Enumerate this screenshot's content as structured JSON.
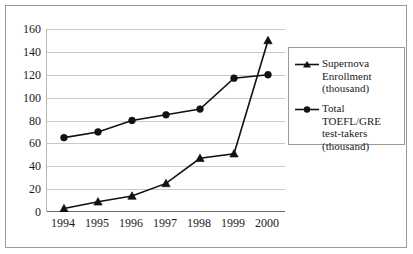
{
  "chart_data": {
    "type": "line",
    "title": "",
    "xlabel": "",
    "ylabel": "",
    "categories": [
      "1994",
      "1995",
      "1996",
      "1997",
      "1998",
      "1999",
      "2000"
    ],
    "ylim": [
      0,
      160
    ],
    "ytick_step": 20,
    "yticks": [
      "0",
      "20",
      "40",
      "60",
      "80",
      "100",
      "120",
      "140",
      "160"
    ],
    "grid": true,
    "legend_position": "right",
    "series": [
      {
        "name": "Supernova Enrollment (thousand)",
        "legend_label": "Supernova\nEnrollment\n(thousand)",
        "marker": "triangle",
        "color": "#111111",
        "values": [
          3,
          9,
          14,
          25,
          47,
          51,
          150
        ]
      },
      {
        "name": "Total TOEFL/GRE test-takers (thousand)",
        "legend_label": "Total TOEFL/GRE\ntest-takers\n(thousand)",
        "marker": "circle",
        "color": "#111111",
        "values": [
          65,
          70,
          80,
          85,
          90,
          117,
          120
        ]
      }
    ]
  },
  "axis": {
    "grid_color": "#c9c9c9",
    "axis_color": "#6b6b6b",
    "frame_color": "#9a9a9a"
  }
}
